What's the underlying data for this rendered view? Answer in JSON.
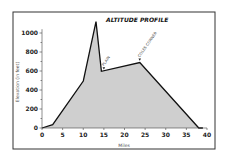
{
  "chart_data": {
    "type": "area",
    "title": "ALTITUDE PROFILE",
    "xlabel": "Miles",
    "ylabel": "Elevation (in feet)",
    "xlim": [
      0,
      40
    ],
    "ylim": [
      0,
      1100
    ],
    "x_ticks": [
      0,
      5,
      10,
      15,
      20,
      25,
      30,
      35,
      40
    ],
    "y_ticks": [
      0,
      200,
      400,
      600,
      800,
      1000
    ],
    "grid": false,
    "legend": null,
    "series": [
      {
        "name": "Elevation",
        "x": [
          0,
          2.6,
          10,
          13.1,
          14.4,
          23.7,
          38,
          39
        ],
        "y": [
          0,
          35,
          495,
          1120,
          597,
          690,
          0,
          0
        ]
      }
    ],
    "annotations": [
      {
        "text": "PLAIN",
        "x": 15,
        "y": 597
      },
      {
        "text": "COLES CORNER",
        "x": 23.7,
        "y": 690
      }
    ],
    "colors": {
      "fill": "#cfcfcf",
      "line": "#111111",
      "frame": "#333333"
    }
  }
}
